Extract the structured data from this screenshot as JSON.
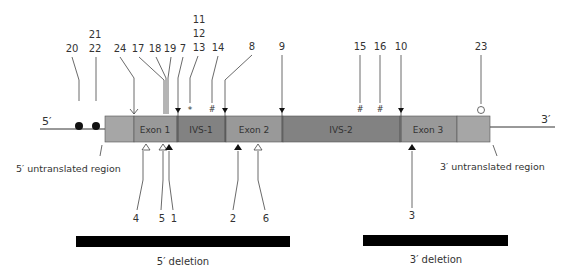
{
  "gene": {
    "strand_5_label": "5′",
    "strand_3_label": "3′",
    "segments": [
      {
        "name": "5utr",
        "label": "",
        "x1": 105,
        "x2": 134,
        "color": "#a6a6a6"
      },
      {
        "name": "exon-1",
        "label": "Exon 1",
        "x1": 134,
        "x2": 177,
        "color": "#999999"
      },
      {
        "name": "ivs-1",
        "label": "IVS-1",
        "x1": 177,
        "x2": 226,
        "color": "#808080"
      },
      {
        "name": "exon-2",
        "label": "Exon 2",
        "x1": 226,
        "x2": 283,
        "color": "#999999"
      },
      {
        "name": "ivs-2",
        "label": "IVS-2",
        "x1": 283,
        "x2": 400,
        "color": "#808080"
      },
      {
        "name": "exon-3",
        "label": "Exon 3",
        "x1": 400,
        "x2": 457,
        "color": "#999999"
      },
      {
        "name": "3utr",
        "label": "",
        "x1": 457,
        "x2": 490,
        "color": "#a6a6a6"
      }
    ]
  },
  "regions": {
    "utr5_label": "5′ untranslated region",
    "utr3_label": "3′ untranslated region"
  },
  "mutations_top": [
    {
      "label": "20",
      "marker": "filled-circle"
    },
    {
      "label": "21",
      "marker": "filled-circle"
    },
    {
      "label": "22",
      "marker": "filled-circle"
    },
    {
      "label": "24",
      "marker": "v-split"
    },
    {
      "label": "17",
      "marker": "line"
    },
    {
      "label": "18",
      "marker": "line"
    },
    {
      "label": "19",
      "marker": "line"
    },
    {
      "label": "7",
      "marker": "down-arrow"
    },
    {
      "label": "11",
      "marker": "asterisk"
    },
    {
      "label": "12",
      "marker": "asterisk"
    },
    {
      "label": "13",
      "marker": "asterisk"
    },
    {
      "label": "14",
      "marker": "hash"
    },
    {
      "label": "8",
      "marker": "down-arrow"
    },
    {
      "label": "9",
      "marker": "down-arrow"
    },
    {
      "label": "15",
      "marker": "hash"
    },
    {
      "label": "16",
      "marker": "hash"
    },
    {
      "label": "10",
      "marker": "down-arrow"
    },
    {
      "label": "23",
      "marker": "open-circle"
    }
  ],
  "mutations_bottom": [
    {
      "label": "4",
      "marker": "open-triangle"
    },
    {
      "label": "5",
      "marker": "open-triangle"
    },
    {
      "label": "1",
      "marker": "filled-triangle"
    },
    {
      "label": "2",
      "marker": "filled-triangle"
    },
    {
      "label": "6",
      "marker": "open-triangle"
    },
    {
      "label": "3",
      "marker": "filled-triangle"
    }
  ],
  "deletions": [
    {
      "label": "5′ deletion",
      "x1": 76,
      "x2": 290
    },
    {
      "label": "3′ deletion",
      "x1": 363,
      "x2": 508
    }
  ],
  "symbols": {
    "asterisk": "*",
    "hash": "#"
  }
}
